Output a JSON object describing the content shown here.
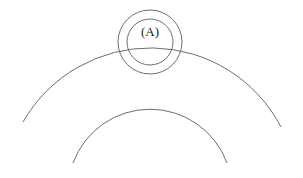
{
  "diagram": {
    "label": "(A)",
    "colors": {
      "stroke": "#6e6e6e",
      "text": "#222222",
      "background": "#ffffff"
    },
    "shapes": {
      "outer_ring": {
        "cx": 150,
        "cy": 42,
        "r": 32
      },
      "inner_ring": {
        "cx": 150,
        "cy": 42,
        "r": 23
      },
      "large_arc": {
        "start": [
          23,
          122
        ],
        "apex": [
          150,
          46
        ],
        "end": [
          281,
          127
        ],
        "r": 147
      },
      "small_arc": {
        "start": [
          73,
          163
        ],
        "apex": [
          150,
          109
        ],
        "end": [
          227,
          163
        ],
        "r": 82
      }
    }
  }
}
